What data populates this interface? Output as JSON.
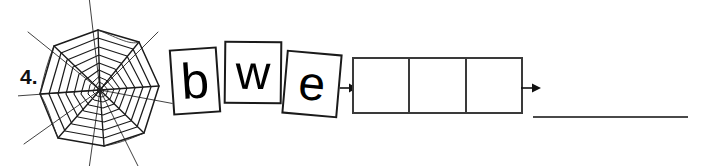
{
  "worksheet": {
    "item_number": "4.",
    "picture": {
      "icon": "spider-web-icon",
      "alt": "spider web"
    },
    "scrambled_letters": [
      {
        "letter": "b"
      },
      {
        "letter": "w"
      },
      {
        "letter": "e"
      }
    ],
    "answer_boxes": [
      {
        "value": ""
      },
      {
        "value": ""
      },
      {
        "value": ""
      }
    ],
    "arrows": [
      {
        "icon": "arrow-right-icon"
      },
      {
        "icon": "arrow-right-icon"
      }
    ],
    "answer_line": {
      "value": ""
    },
    "colors": {
      "ink": "#111111",
      "box_stroke": "#3a3a3a",
      "tile_stroke": "#1a1a1a",
      "line": "#4a4a4a",
      "background": "#ffffff"
    }
  }
}
